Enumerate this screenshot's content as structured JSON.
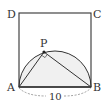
{
  "diagram": {
    "type": "geometry",
    "points": {
      "A": {
        "label": "A"
      },
      "B": {
        "label": "B"
      },
      "C": {
        "label": "C"
      },
      "D": {
        "label": "D"
      },
      "P": {
        "label": "P"
      }
    },
    "measurements": {
      "AB": "10"
    },
    "right_angle_at": "P",
    "colors": {
      "stroke": "#333333",
      "fill_semicircle": "#f0f0f0",
      "dashed": "#888888"
    }
  }
}
